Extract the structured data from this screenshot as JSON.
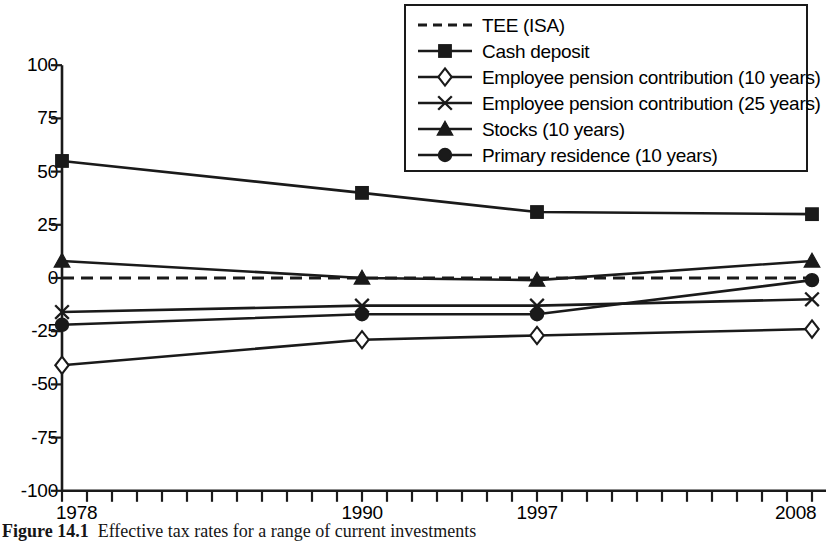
{
  "figure": {
    "caption_label": "Figure 14.1",
    "caption_text": "Effective tax rates for a range of current investments"
  },
  "chart_data": {
    "type": "line",
    "title": "",
    "xlabel": "",
    "ylabel": "",
    "x": [
      1978,
      1990,
      1997,
      2008
    ],
    "xtick_labels": [
      "1978",
      "1990",
      "1997",
      "2008"
    ],
    "xlim": [
      1978,
      2008
    ],
    "ytick_labels": [
      "100",
      "75",
      "50",
      "25",
      "0",
      "-25",
      "-50",
      "-75",
      "-100"
    ],
    "yticks": [
      100,
      75,
      50,
      25,
      0,
      -25,
      -50,
      -75,
      -100
    ],
    "ylim": [
      -100,
      100
    ],
    "grid": false,
    "legend_position": "top-right",
    "minor_xticks_per_year": true,
    "series": [
      {
        "name": "TEE (ISA)",
        "marker": "none",
        "linestyle": "dashed",
        "values": [
          0,
          0,
          0,
          0
        ]
      },
      {
        "name": "Cash deposit",
        "marker": "square-filled",
        "linestyle": "solid",
        "values": [
          55,
          40,
          31,
          30
        ]
      },
      {
        "name": "Employee pension contribution (10 years)",
        "marker": "diamond-open",
        "linestyle": "solid",
        "values": [
          -41,
          -29,
          -27,
          -24
        ]
      },
      {
        "name": "Employee pension contribution (25 years)",
        "marker": "x-cross",
        "linestyle": "solid",
        "values": [
          -16,
          -13,
          -13,
          -10
        ]
      },
      {
        "name": "Stocks (10 years)",
        "marker": "triangle-filled",
        "linestyle": "solid",
        "values": [
          8,
          0,
          -1,
          8
        ]
      },
      {
        "name": "Primary residence (10 years)",
        "marker": "circle-filled",
        "linestyle": "solid",
        "values": [
          -22,
          -17,
          -17,
          -1
        ]
      }
    ]
  },
  "legend": {
    "items": [
      {
        "label": "TEE (ISA)",
        "marker": "none",
        "linestyle": "dashed"
      },
      {
        "label": "Cash deposit",
        "marker": "square-filled",
        "linestyle": "solid"
      },
      {
        "label": "Employee pension contribution (10 years)",
        "marker": "diamond-open",
        "linestyle": "solid"
      },
      {
        "label": "Employee pension contribution (25 years)",
        "marker": "x-cross",
        "linestyle": "solid"
      },
      {
        "label": "Stocks (10 years)",
        "marker": "triangle-filled",
        "linestyle": "solid"
      },
      {
        "label": "Primary residence (10 years)",
        "marker": "circle-filled",
        "linestyle": "solid"
      }
    ]
  },
  "colors": {
    "ink": "#1a1a1a",
    "background": "#ffffff"
  }
}
